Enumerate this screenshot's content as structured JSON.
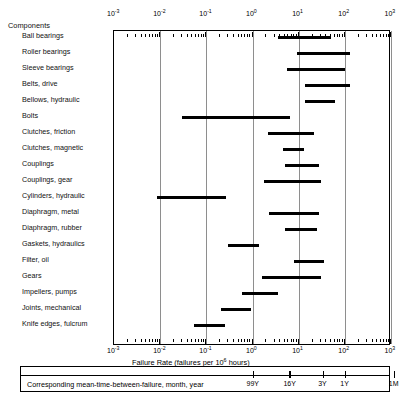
{
  "header": {
    "components_label": "Components"
  },
  "axis": {
    "title_pre": "Failure Rate (failures per 10",
    "title_sup": "6",
    "title_post": " hours)",
    "tick_labels": [
      "10-3",
      "10-2",
      "10-1",
      "100",
      "101",
      "102",
      "103"
    ],
    "exponents": [
      "-3",
      "-2",
      "-1",
      "0",
      "1",
      "2",
      "3"
    ],
    "mantissa": "10",
    "range_min_log": -3,
    "range_max_log": 3
  },
  "mtbf": {
    "caption": "Corresponding mean-time-between-failure, month, year",
    "ticks": [
      {
        "label": "99Y",
        "log": 0.0
      },
      {
        "label": "16Y",
        "log": 0.8
      },
      {
        "label": "3Y",
        "log": 1.52
      },
      {
        "label": "1Y",
        "log": 2.0
      },
      {
        "label": "1M",
        "log": 3.06
      }
    ]
  },
  "chart_data": {
    "type": "bar",
    "orientation": "horizontal-range",
    "title": "",
    "xlabel": "Failure Rate (failures per 10^6 hours)",
    "ylabel": "Components",
    "xscale": "log",
    "xlim": [
      0.001,
      1000
    ],
    "grid": true,
    "legend": "none",
    "categories": [
      "Ball bearings",
      "Roller bearings",
      "Sleeve bearings",
      "Belts, drive",
      "Bellows, hydraulic",
      "Bolts",
      "Clutches, friction",
      "Clutches, magnetic",
      "Couplings",
      "Couplings, gear",
      "Cylinders, hydraulic",
      "Diaphragm, metal",
      "Diaphragm, rubber",
      "Gaskets, hydraulics",
      "Filter, oil",
      "Gears",
      "Impellers, pumps",
      "Joints, mechanical",
      "Knife edges, fulcrum"
    ],
    "bars": [
      {
        "label": "Ball bearings",
        "low": 3.5,
        "high": 50.0
      },
      {
        "label": "Roller bearings",
        "low": 9.0,
        "high": 130.0
      },
      {
        "label": "Sleeve bearings",
        "low": 5.5,
        "high": 100.0
      },
      {
        "label": "Belts, drive",
        "low": 14.0,
        "high": 130.0
      },
      {
        "label": "Bellows, hydraulic",
        "low": 14.0,
        "high": 60.0
      },
      {
        "label": "Bolts",
        "low": 0.03,
        "high": 6.5
      },
      {
        "label": "Clutches, friction",
        "low": 2.2,
        "high": 22.0
      },
      {
        "label": "Clutches, magnetic",
        "low": 4.5,
        "high": 13.0
      },
      {
        "label": "Couplings",
        "low": 5.0,
        "high": 28.0
      },
      {
        "label": "Couplings, gear",
        "low": 1.8,
        "high": 30.0
      },
      {
        "label": "Cylinders, hydraulic",
        "low": 0.0085,
        "high": 0.27
      },
      {
        "label": "Diaphragm, metal",
        "low": 2.3,
        "high": 28.0
      },
      {
        "label": "Diaphragm, rubber",
        "low": 5.0,
        "high": 25.0
      },
      {
        "label": "Gaskets, hydraulics",
        "low": 0.3,
        "high": 1.4
      },
      {
        "label": "Filter, oil",
        "low": 8.0,
        "high": 35.0
      },
      {
        "label": "Gears",
        "low": 1.6,
        "high": 30.0
      },
      {
        "label": "Impellers, pumps",
        "low": 0.6,
        "high": 3.5
      },
      {
        "label": "Joints, mechanical",
        "low": 0.21,
        "high": 0.95
      },
      {
        "label": "Knife edges, fulcrum",
        "low": 0.055,
        "high": 0.25
      }
    ]
  }
}
